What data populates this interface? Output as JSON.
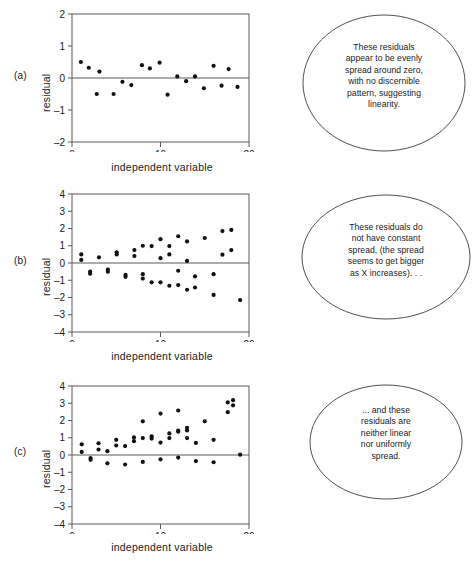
{
  "figure": {
    "title": "",
    "axis_color": "#5a5a5a",
    "point_color": "#111111",
    "bubble_stroke": "#3c3c3c"
  },
  "panels": [
    {
      "label": "(a)",
      "ylabel": "residual",
      "xlabel": "independent variable",
      "bubble_text": "These residuals\nappear to be evenly\nspread around zero,\nwith no discernible\npattern, suggesting\nlinearity."
    },
    {
      "label": "(b)",
      "ylabel": "residual",
      "xlabel": "independent variable",
      "bubble_text": "These residuals do\nnot have constant\nspread, (the spread\nseems to get bigger\nas X increases). . ."
    },
    {
      "label": "(c)",
      "ylabel": "residual",
      "xlabel": "independent variable",
      "bubble_text": "... and these\nresiduals are\nneither linear\nnor uniformly\nspread."
    }
  ],
  "chart_data": [
    {
      "type": "scatter",
      "panel": "a",
      "title": "",
      "xlabel": "independent variable",
      "ylabel": "residual",
      "xlim": [
        0,
        20
      ],
      "ylim": [
        -2,
        2
      ],
      "xticks": [
        0,
        10,
        20
      ],
      "yticks": [
        -2,
        -1,
        0,
        1,
        2
      ],
      "grid": false,
      "reference_line_y": 0,
      "points": [
        [
          1.0,
          0.5
        ],
        [
          1.9,
          0.32
        ],
        [
          2.8,
          0.5
        ],
        [
          3.1,
          0.2
        ],
        [
          4.7,
          0.5
        ],
        [
          5.7,
          0.12
        ],
        [
          6.7,
          0.22
        ],
        [
          7.9,
          0.4
        ],
        [
          8.8,
          0.3
        ],
        [
          9.9,
          0.48
        ],
        [
          10.8,
          0.52
        ],
        [
          11.9,
          0.05
        ],
        [
          12.9,
          0.1
        ],
        [
          13.9,
          0.05
        ],
        [
          14.9,
          0.32
        ],
        [
          16.0,
          0.38
        ],
        [
          16.9,
          0.24
        ],
        [
          17.7,
          0.28
        ],
        [
          18.7,
          0.28
        ]
      ],
      "signs": [
        1,
        1,
        -1,
        1,
        -1,
        -1,
        -1,
        1,
        1,
        1,
        -1,
        1,
        -1,
        1,
        -1,
        1,
        -1,
        1,
        -1
      ],
      "note": "points alternate above/below zero; evenly scattered, no pattern"
    },
    {
      "type": "scatter",
      "panel": "b",
      "title": "",
      "xlabel": "independent variable",
      "ylabel": "residual",
      "xlim": [
        0,
        20
      ],
      "ylim": [
        -4,
        4
      ],
      "xticks": [
        0,
        10,
        20
      ],
      "yticks": [
        -4,
        -3,
        -2,
        -1,
        0,
        1,
        2,
        3,
        4
      ],
      "grid": false,
      "reference_line_y": 0,
      "points": [
        [
          1.05,
          0.5
        ],
        [
          1.05,
          0.18
        ],
        [
          2.05,
          -0.5
        ],
        [
          2.05,
          -0.62
        ],
        [
          3.05,
          0.33
        ],
        [
          4.05,
          -0.38
        ],
        [
          4.05,
          -0.5
        ],
        [
          5.05,
          0.62
        ],
        [
          5.05,
          0.5
        ],
        [
          6.05,
          -0.68
        ],
        [
          6.05,
          -0.8
        ],
        [
          7.05,
          0.75
        ],
        [
          7.05,
          0.4
        ],
        [
          8.0,
          1.0
        ],
        [
          8.0,
          -0.65
        ],
        [
          8.0,
          -0.9
        ],
        [
          9.0,
          0.98
        ],
        [
          9.0,
          -1.12
        ],
        [
          10.0,
          1.38
        ],
        [
          10.0,
          0.28
        ],
        [
          10.0,
          -1.12
        ],
        [
          11.0,
          0.98
        ],
        [
          11.0,
          0.5
        ],
        [
          11.0,
          -1.32
        ],
        [
          12.0,
          1.55
        ],
        [
          12.0,
          -1.28
        ],
        [
          12.0,
          -0.45
        ],
        [
          13.0,
          1.25
        ],
        [
          13.0,
          0.12
        ],
        [
          13.0,
          -1.55
        ],
        [
          13.9,
          -0.78
        ],
        [
          13.9,
          -1.42
        ],
        [
          15.0,
          1.45
        ],
        [
          16.0,
          -0.65
        ],
        [
          16.0,
          -1.85
        ],
        [
          17.0,
          1.85
        ],
        [
          17.0,
          0.48
        ],
        [
          18.0,
          1.92
        ],
        [
          18.0,
          0.75
        ],
        [
          19.0,
          -2.15
        ]
      ],
      "note": "funnel / megaphone shape: vertical spread increases with x (heteroscedastic)"
    },
    {
      "type": "scatter",
      "panel": "c",
      "title": "",
      "xlabel": "independent variable",
      "ylabel": "residual",
      "xlim": [
        0,
        20
      ],
      "ylim": [
        -4,
        4
      ],
      "xticks": [
        0,
        10,
        20
      ],
      "yticks": [
        -4,
        -3,
        -2,
        -1,
        0,
        1,
        2,
        3,
        4
      ],
      "grid": false,
      "reference_line_y": 0,
      "points": [
        [
          1.1,
          0.62
        ],
        [
          1.1,
          0.18
        ],
        [
          2.1,
          -0.18
        ],
        [
          2.1,
          -0.28
        ],
        [
          3.0,
          0.68
        ],
        [
          3.0,
          0.32
        ],
        [
          4.0,
          0.22
        ],
        [
          4.0,
          -0.48
        ],
        [
          5.0,
          0.88
        ],
        [
          5.0,
          0.55
        ],
        [
          6.0,
          0.52
        ],
        [
          6.0,
          -0.55
        ],
        [
          7.0,
          0.8
        ],
        [
          7.0,
          1.02
        ],
        [
          8.0,
          1.95
        ],
        [
          8.0,
          0.98
        ],
        [
          8.0,
          -0.4
        ],
        [
          9.0,
          1.08
        ],
        [
          9.0,
          0.95
        ],
        [
          10.0,
          2.4
        ],
        [
          10.0,
          0.72
        ],
        [
          10.0,
          -0.25
        ],
        [
          11.0,
          1.25
        ],
        [
          11.0,
          0.98
        ],
        [
          12.0,
          2.58
        ],
        [
          12.0,
          1.35
        ],
        [
          12.0,
          1.42
        ],
        [
          12.0,
          -0.15
        ],
        [
          13.0,
          1.58
        ],
        [
          13.0,
          1.42
        ],
        [
          13.0,
          0.98
        ],
        [
          14.0,
          0.7
        ],
        [
          14.0,
          -0.35
        ],
        [
          15.0,
          1.95
        ],
        [
          16.0,
          0.88
        ],
        [
          16.0,
          -0.42
        ],
        [
          17.6,
          3.05
        ],
        [
          17.6,
          2.48
        ],
        [
          18.2,
          3.18
        ],
        [
          18.2,
          2.88
        ],
        [
          19.0,
          0.02
        ]
      ],
      "note": "upward curving trend with increasing spread: neither linear nor uniform"
    }
  ]
}
